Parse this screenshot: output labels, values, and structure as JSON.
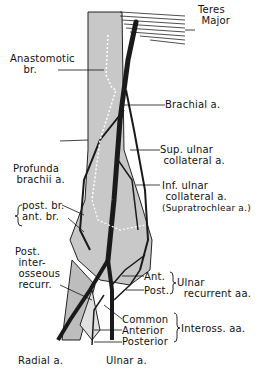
{
  "figure": {
    "colors": {
      "bone": "#c8c8c8",
      "artery": "#1a1a1a",
      "line": "#111111",
      "background": "#ffffff"
    }
  },
  "labels": {
    "teres_major_1": "Teres",
    "teres_major_2": "Major",
    "anastomotic_1": "Anastomotic",
    "anastomotic_2": "br.",
    "brachial": "Brachial a.",
    "sup_ulnar_1": "Sup. ulnar",
    "sup_ulnar_2": "collateral a.",
    "profunda_1": "Profunda",
    "profunda_2": "brachii a.",
    "inf_ulnar_1": "Inf. ulnar",
    "inf_ulnar_2": "collateral a.",
    "inf_ulnar_3": "(Supratrochlear a.)",
    "post_br": "post. br.",
    "ant_br": "ant. br.",
    "post_inter_1": "Post.",
    "post_inter_2": "inter-",
    "post_inter_3": "osseous",
    "post_inter_4": "recurr.",
    "ulnar_rec_ant": "Ant.",
    "ulnar_rec_post": "Post.",
    "ulnar_rec_1": "Ulnar",
    "ulnar_rec_2": "recurrent aa.",
    "inteross_common": "Common",
    "inteross_anterior": "Anterior",
    "inteross_posterior": "Posterior",
    "inteross_group": "Inteross. aa.",
    "radial": "Radial a.",
    "ulnar": "Ulnar a."
  }
}
